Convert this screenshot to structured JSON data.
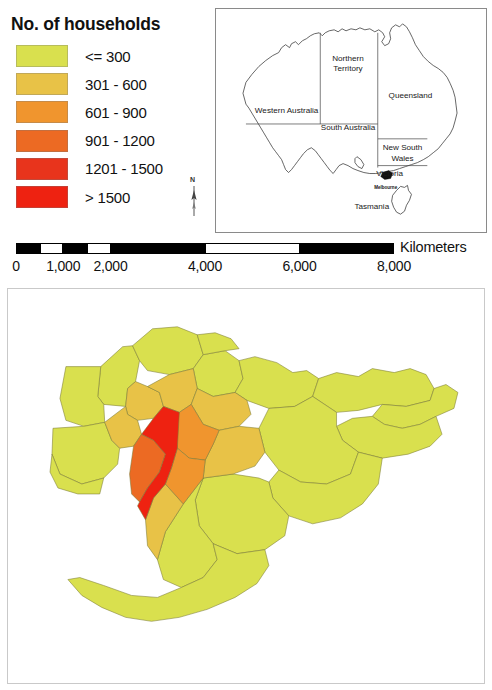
{
  "legend": {
    "title": "No. of households",
    "classes": [
      {
        "label": "<= 300",
        "color": "#d9e04e",
        "min": 0,
        "max": 300
      },
      {
        "label": "301 - 600",
        "color": "#e8c247",
        "min": 301,
        "max": 600
      },
      {
        "label": "601 - 900",
        "color": "#f0952e",
        "min": 601,
        "max": 900
      },
      {
        "label": "901 - 1200",
        "color": "#ec6a23",
        "min": 901,
        "max": 1200
      },
      {
        "label": "1201 - 1500",
        "color": "#e8341c",
        "min": 1201,
        "max": 1500
      },
      {
        "label": "> 1500",
        "color": "#ee2211",
        "min": 1501,
        "max": null
      }
    ]
  },
  "north_arrow": {
    "label": "N"
  },
  "inset_map": {
    "state_labels": [
      {
        "name": "Northern Territory",
        "line1": "Northern",
        "line2": "Territory"
      },
      {
        "name": "Queensland",
        "line1": "Queensland",
        "line2": ""
      },
      {
        "name": "Western Australia",
        "line1": "Western Australia",
        "line2": ""
      },
      {
        "name": "South Australia",
        "line1": "South Australia",
        "line2": ""
      },
      {
        "name": "New South Wales",
        "line1": "New South",
        "line2": "Wales"
      },
      {
        "name": "Victoria",
        "line1": "Victoria",
        "line2": ""
      },
      {
        "name": "Tasmania",
        "line1": "Tasmania",
        "line2": ""
      }
    ],
    "city_label": "Melbourne"
  },
  "scalebar": {
    "units": "Kilometers",
    "ticks": [
      "0",
      "1,000",
      "2,000",
      "4,000",
      "6,000",
      "8,000"
    ],
    "tick_values": [
      0,
      1000,
      2000,
      4000,
      6000,
      8000
    ],
    "max": 8000
  },
  "chart_data": {
    "type": "choropleth",
    "title": "No. of households",
    "region": "Greater Melbourne, Victoria, Australia",
    "unit": "households",
    "legend_position": "top-left",
    "classes": [
      "<= 300",
      "301 - 600",
      "601 - 900",
      "901 - 1200",
      "1201 - 1500",
      "> 1500"
    ],
    "class_colors": [
      "#d9e04e",
      "#e8c247",
      "#f0952e",
      "#ec6a23",
      "#e8341c",
      "#ee2211"
    ],
    "class_counts": [
      30,
      9,
      5,
      2,
      1,
      1
    ],
    "features": [
      {
        "id": "nw-outer-1",
        "class_index": 0
      },
      {
        "id": "nw-outer-2",
        "class_index": 0
      },
      {
        "id": "w-outer-1",
        "class_index": 0
      },
      {
        "id": "w-outer-2",
        "class_index": 0
      },
      {
        "id": "n-outer-1",
        "class_index": 0
      },
      {
        "id": "n-outer-2",
        "class_index": 0
      },
      {
        "id": "n-outer-3",
        "class_index": 0
      },
      {
        "id": "ne-outer-1",
        "class_index": 0
      },
      {
        "id": "ne-outer-2",
        "class_index": 0
      },
      {
        "id": "e-outer-1",
        "class_index": 0
      },
      {
        "id": "e-outer-2",
        "class_index": 0
      },
      {
        "id": "se-outer-1",
        "class_index": 0
      },
      {
        "id": "se-outer-2",
        "class_index": 0
      },
      {
        "id": "s-outer-1",
        "class_index": 0
      },
      {
        "id": "s-outer-2",
        "class_index": 0
      },
      {
        "id": "sw-peninsula",
        "class_index": 0
      },
      {
        "id": "inner-nw",
        "class_index": 1
      },
      {
        "id": "inner-n",
        "class_index": 1
      },
      {
        "id": "inner-ne",
        "class_index": 1
      },
      {
        "id": "inner-w",
        "class_index": 1
      },
      {
        "id": "inner-e",
        "class_index": 1
      },
      {
        "id": "inner-s",
        "class_index": 1
      },
      {
        "id": "mid-e-1",
        "class_index": 2
      },
      {
        "id": "mid-e-2",
        "class_index": 2
      },
      {
        "id": "mid-sw",
        "class_index": 3
      },
      {
        "id": "core-cbd",
        "class_index": 5
      }
    ]
  }
}
